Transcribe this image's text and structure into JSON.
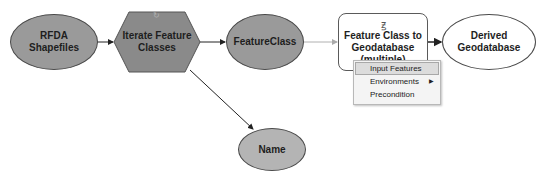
{
  "diagram": {
    "nodes": [
      {
        "id": "rfda_shapefiles",
        "label": "RFDA Shapefiles",
        "shape": "ellipse",
        "fill": "#9a9a9a"
      },
      {
        "id": "iterate_feature_classes",
        "label": "Iterate Feature Classes",
        "shape": "hexagon",
        "fill": "#8a8a8a",
        "icon": "iterator-icon"
      },
      {
        "id": "featureclass",
        "label": "FeatureClass",
        "shape": "ellipse",
        "fill": "#9a9a9a"
      },
      {
        "id": "fc_to_gdb",
        "label": "Feature Class to Geodatabase (multiple)",
        "label_lines": [
          "Feature Class to",
          "Geodatabase",
          "(multiple)"
        ],
        "shape": "rounded-rectangle",
        "fill": "#ffffff",
        "icon": "tool-icon"
      },
      {
        "id": "derived_gdb",
        "label": "Derived Geodatabase",
        "shape": "ellipse",
        "fill": "#ffffff"
      },
      {
        "id": "name",
        "label": "Name",
        "shape": "ellipse",
        "fill": "#b4b4b4"
      }
    ],
    "edges": [
      {
        "from": "rfda_shapefiles",
        "to": "iterate_feature_classes"
      },
      {
        "from": "iterate_feature_classes",
        "to": "featureclass"
      },
      {
        "from": "iterate_feature_classes",
        "to": "name"
      },
      {
        "from": "featureclass",
        "to": "fc_to_gdb",
        "style": "light"
      },
      {
        "from": "fc_to_gdb",
        "to": "derived_gdb"
      }
    ],
    "labels": {
      "rfda_line1": "RFDA",
      "rfda_line2": "Shapefiles",
      "iterate_line1": "Iterate Feature",
      "iterate_line2": "Classes",
      "featureclass": "FeatureClass",
      "tool_line1": "Feature Class to",
      "tool_line2": "Geodatabase",
      "tool_line3": "(multiple)",
      "derived_line1": "Derived",
      "derived_line2": "Geodatabase",
      "name": "Name"
    }
  },
  "context_menu": {
    "items": [
      {
        "label": "Input Features",
        "highlighted": true
      },
      {
        "label": "Environments",
        "submenu": true
      },
      {
        "label": "Precondition"
      }
    ],
    "submenu_arrow": "▶"
  },
  "icons": {
    "tool_icon": "ꙃ",
    "iterator_icon": "↻"
  }
}
